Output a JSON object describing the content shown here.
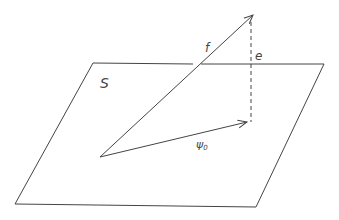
{
  "diagram": {
    "plane": {
      "label": "S"
    },
    "vectors": [
      {
        "name": "f",
        "label": "f",
        "kind": "vector"
      },
      {
        "name": "psi0",
        "label": "ψ",
        "subscript": "0",
        "kind": "vector"
      }
    ],
    "error": {
      "label": "e",
      "style": "dashed"
    },
    "colors": {
      "stroke": "#444444",
      "background": "#ffffff"
    }
  }
}
